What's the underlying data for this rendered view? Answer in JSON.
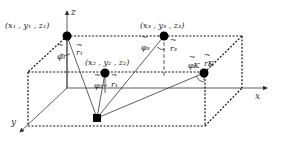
{
  "figure": {
    "axes": {
      "x_label": "x",
      "y_label": "y",
      "z_label": "z"
    },
    "points": [
      {
        "id": "p1",
        "label": "(x₁ , y₁ , z₁)",
        "phi": "φ₁",
        "r": "r₁"
      },
      {
        "id": "p2",
        "label": "(x₂ , y₂ , z₂)",
        "phi": "φ₂",
        "r": "r₁"
      },
      {
        "id": "p3",
        "label": "(x₃ , y₃ , z₃)",
        "phi": "φ₃",
        "r": "r₃"
      },
      {
        "id": "pk",
        "label": "",
        "phi": "φΚ",
        "r": "rΚ"
      }
    ],
    "tilde": "~",
    "colors": {
      "ink": "#111111",
      "background": "#ffffff"
    }
  }
}
